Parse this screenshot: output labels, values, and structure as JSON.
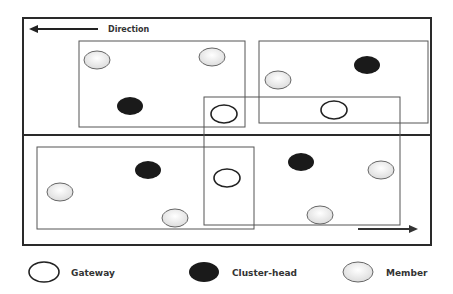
{
  "diagram": {
    "direction_label": "Direction",
    "colors": {
      "outline": "#2a2a2a",
      "box": "#555555",
      "gateway_fill": "#ffffff",
      "cluster_head_fill": "#1a1a1a",
      "member_fill": "#eeeeee"
    },
    "legend": [
      {
        "kind": "gateway",
        "label": "Gateway"
      },
      {
        "kind": "cluster-head",
        "label": "Cluster-head"
      },
      {
        "kind": "member",
        "label": "Member"
      }
    ]
  }
}
